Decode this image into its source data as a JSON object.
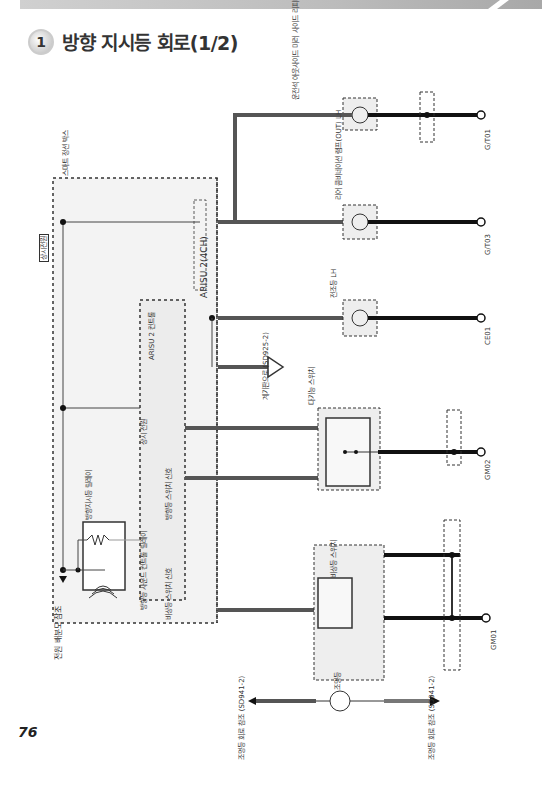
{
  "header": {
    "section_number": "1",
    "title": "방향 지시등 회로(1/2)"
  },
  "page_number": "76",
  "modules": {
    "smart_junction_box": {
      "label": "스마트 정션 박스",
      "ref": "P.52 C.56-2/4/6"
    },
    "arisu": {
      "label": "ARISU 2(4CH)"
    },
    "arisu_controller": {
      "label": "ARISU 2 컨트롤",
      "sub": "IPS 컨트롤 모듈"
    },
    "constant_power": {
      "label": "상시전원"
    },
    "power_ref": {
      "label": "전원 배분도 참조",
      "ref": "(SD110-7)"
    },
    "relay": {
      "label": "방향지시등 릴레이"
    },
    "relay_signal": {
      "label": "방향등 사운드 컨트롤 릴레이"
    },
    "const_power_inner": {
      "label": "상시 전원"
    },
    "turn_switch_signal": {
      "label": "방향등 스위치 신호",
      "lh": "LH",
      "rh": "RH"
    },
    "hazard_signal": {
      "label": "비상등 스위치 신호"
    }
  },
  "components": [
    {
      "name": "side_repeater",
      "label": "운전석 아웃사이드 미러 사이드 리피터",
      "ref": "P.72 C.35-2",
      "inner": "방향등",
      "pins": [
        "D10 11",
        "D10 12"
      ]
    },
    {
      "name": "rear_combo_lh",
      "label": "리어 콤비네이션 램프(OUT) LH",
      "ref": "P.105 C.85-4",
      "inner": "방향등",
      "pins": [
        "F29 1",
        "F29 3"
      ]
    },
    {
      "name": "headlamp_lh",
      "label": "전조등 LH",
      "ref": "P.11 C.28-3",
      "inner": "방향등",
      "pins": [
        "E05 1",
        "E05 5"
      ],
      "note": "2(LED 미적용) 6(LED 적용)"
    },
    {
      "name": "multifunction_switch",
      "label": "다기능 스위치",
      "ref": "P.53 C.18-1",
      "inner": "방향등 스위치",
      "pins": [
        "M01-L 13",
        "M01-L 11",
        "M01-L 2"
      ],
      "lh": "LH",
      "rh": "RH"
    },
    {
      "name": "hazard_switch",
      "label": "비상등 스위치",
      "ref": "P.10/62 C.10-13/11",
      "sub": "에어컨 컨트롤 모듈",
      "photo": "PHOTO 97",
      "on": "ON",
      "off": "OFF",
      "ground": "접지"
    },
    {
      "name": "illumination",
      "label": "조명등",
      "pins": [
        "1",
        "17",
        "22",
        "22"
      ]
    }
  ],
  "wires": [
    {
      "from": "IP-R 7",
      "to": "FD11 24",
      "color": "0.3L/O"
    },
    {
      "from": "FD11",
      "to": "D10",
      "color": "0.3L/O"
    },
    {
      "from": "D10 12",
      "to": "G/T01",
      "color": "0.3B / 2.0B"
    },
    {
      "from": "IP-R 7",
      "to": "F29 1",
      "color": "0.5L/O"
    },
    {
      "from": "F29 3",
      "to": "G/T03",
      "color": "0.85B"
    },
    {
      "from": "IP-F 25",
      "to": "E05 1",
      "color": "0.5L/O"
    },
    {
      "from": "E05 5",
      "to": "CE01",
      "color": "0.5B"
    },
    {
      "from": "IP-G 16",
      "to": "A 계기판",
      "color": "0.3R/O"
    },
    {
      "from": "17",
      "to": "M01-L 13",
      "color": "0.5G/O"
    },
    {
      "from": "10",
      "to": "M01-L 11",
      "color": "0.5L/O"
    },
    {
      "from": "M01-L 2",
      "to": "GM02",
      "color": "0.5B / 1.25B"
    },
    {
      "from": "14",
      "to": "hazard switch 22",
      "color": "0.5R"
    },
    {
      "from": "hazard 접지",
      "to": "GM01",
      "color": "0.5B / 1.25B / 0.5B"
    },
    {
      "from": "조명등 1",
      "to": "",
      "color": "0.3L"
    },
    {
      "from": "조명등 22",
      "to": "조명등 회로 참조",
      "color": "0.3Gr"
    }
  ],
  "grounds": [
    {
      "name": "G/T01",
      "ref": "P.76"
    },
    {
      "name": "G/T03",
      "ref": "P.80"
    },
    {
      "name": "CE01",
      "ref": "P.4"
    },
    {
      "name": "GM02",
      "ref": "P.61"
    },
    {
      "name": "GM01",
      "ref": "P.58"
    }
  ],
  "connectors": [
    {
      "name": "FD11",
      "ref": "P.67",
      "pins": [
        "24",
        "2"
      ]
    },
    {
      "name": "UDA",
      "ref": "접지 배분도 참조 (SD130-4)"
    },
    {
      "name": "LMF",
      "ref": "접지 배분도 참조 (SD130-2)"
    },
    {
      "name": "LME",
      "ref": "접지 배분도 참조 (SD130-1)"
    }
  ],
  "refs": {
    "gauge": "계기판으로 (SD925-2)",
    "illum_in": "조명등 회로 참조 (SD941-2)",
    "illum_out": "조명등 회로 참조 (SD941-2)",
    "wire_m21_top": "M21-B(오토 에어컨) M22-B(메뉴얼 에어컨)",
    "wire_m21_mid": "M21-B (오토 에어컨)",
    "gnd_label": "접지"
  },
  "colors": {
    "wire_dark": "#1a1a1a",
    "wire_gray": "#555555",
    "module_fill": "#f0f0f0"
  }
}
